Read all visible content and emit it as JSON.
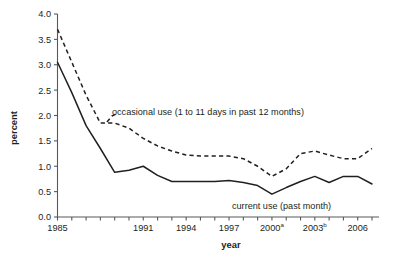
{
  "chart_data": {
    "type": "line",
    "title": "",
    "xlabel": "year",
    "ylabel": "percent",
    "ylim": [
      0.0,
      4.0
    ],
    "xlim": [
      1985,
      2007
    ],
    "grid": false,
    "legend_position": "inline-annotations",
    "ytick_labels": [
      "0.0",
      "0.5",
      "1.0",
      "1.5",
      "2.0",
      "2.5",
      "3.0",
      "3.5",
      "4.0"
    ],
    "ytick_values": [
      0.0,
      0.5,
      1.0,
      1.5,
      2.0,
      2.5,
      3.0,
      3.5,
      4.0
    ],
    "xtick_values": [
      1985,
      1986,
      1987,
      1988,
      1989,
      1990,
      1991,
      1992,
      1993,
      1994,
      1995,
      1996,
      1997,
      1998,
      1999,
      2000,
      2001,
      2002,
      2003,
      2004,
      2005,
      2006,
      2007
    ],
    "xtick_labeled": [
      {
        "value": 1985,
        "label": "1985",
        "superscript": ""
      },
      {
        "value": 1991,
        "label": "1991",
        "superscript": ""
      },
      {
        "value": 1994,
        "label": "1994",
        "superscript": ""
      },
      {
        "value": 1997,
        "label": "1997",
        "superscript": ""
      },
      {
        "value": 2000,
        "label": "2000",
        "superscript": "a"
      },
      {
        "value": 2003,
        "label": "2003",
        "superscript": "b"
      },
      {
        "value": 2006,
        "label": "2006",
        "superscript": ""
      }
    ],
    "x": [
      1985,
      1986,
      1987,
      1988,
      1989,
      1990,
      1991,
      1992,
      1993,
      1994,
      1995,
      1996,
      1997,
      1998,
      1999,
      2000,
      2001,
      2002,
      2003,
      2004,
      2005,
      2006,
      2007
    ],
    "series": [
      {
        "name": "occasional use (1 to 11 days in past 12 months)",
        "style": "dashed",
        "values": [
          3.7,
          3.05,
          2.4,
          1.85,
          1.85,
          1.75,
          1.55,
          1.4,
          1.3,
          1.22,
          1.2,
          1.2,
          1.2,
          1.15,
          1.0,
          0.8,
          0.95,
          1.25,
          1.3,
          1.22,
          1.15,
          1.15,
          1.35
        ]
      },
      {
        "name": "current use (past month)",
        "style": "solid",
        "values": [
          3.05,
          2.45,
          1.8,
          1.35,
          0.88,
          0.92,
          1.0,
          0.82,
          0.7,
          0.7,
          0.7,
          0.7,
          0.72,
          0.68,
          0.62,
          0.45,
          0.58,
          0.7,
          0.8,
          0.68,
          0.8,
          0.8,
          0.65
        ]
      }
    ],
    "annotations": [
      {
        "name": "occasional-use-label",
        "text": "occasional use (1 to 11 days in past 12 months)"
      },
      {
        "name": "current-use-label",
        "text": "current use (past month)"
      }
    ]
  }
}
